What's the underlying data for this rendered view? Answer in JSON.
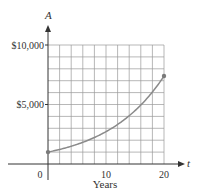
{
  "chart_data": {
    "type": "line",
    "title": "",
    "xlabel": "Years",
    "ylabel": "",
    "x_axis_symbol": "t",
    "y_axis_symbol": "A",
    "xlim": [
      0,
      20
    ],
    "ylim": [
      0,
      10000
    ],
    "x_ticks": [
      {
        "value": 0,
        "label": "0"
      },
      {
        "value": 10,
        "label": "10"
      },
      {
        "value": 20,
        "label": "20"
      }
    ],
    "y_ticks": [
      {
        "value": 5000,
        "label": "$5,000"
      },
      {
        "value": 10000,
        "label": "$10,000"
      }
    ],
    "grid": {
      "on": true,
      "x_step": 2,
      "y_step": 1000
    },
    "series": [
      {
        "name": "A(t)",
        "description": "Exponential growth, approx A = 1000·e^(0.1t)",
        "x": [
          0,
          2,
          4,
          6,
          8,
          10,
          12,
          14,
          16,
          18,
          20
        ],
        "values": [
          1000,
          1221,
          1492,
          1822,
          2226,
          2718,
          3320,
          4055,
          4953,
          6050,
          7389
        ],
        "endpoints_marked": true
      }
    ],
    "legend": null
  },
  "colors": {
    "grid": "#9a9a9a",
    "axis": "#333333",
    "curve": "#8a8a8a",
    "point": "#7a7a7a"
  }
}
